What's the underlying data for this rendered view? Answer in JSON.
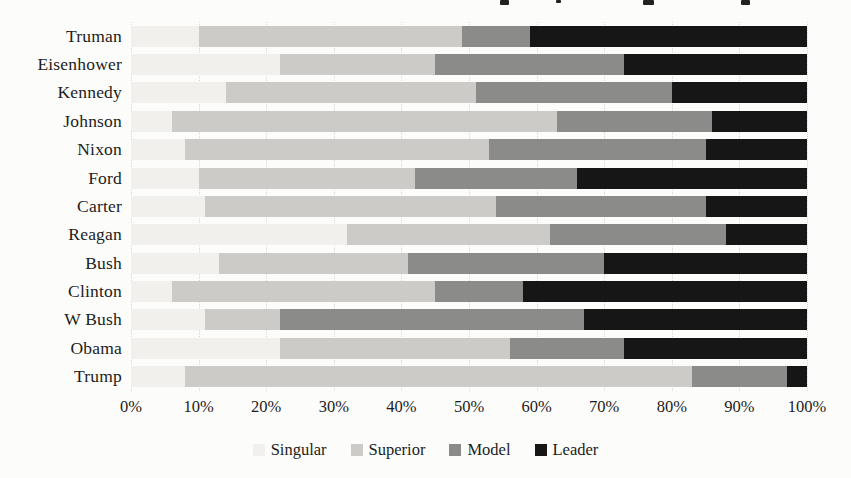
{
  "page": {
    "background": "#fcfcfa",
    "text_color": "#1c1c1c",
    "gridline_color": "#dbd8d4"
  },
  "chart_data": {
    "type": "bar",
    "orientation": "horizontal",
    "stacked": true,
    "stacked_total": 100,
    "title": "",
    "xlabel": "",
    "ylabel": "",
    "categories": [
      "Truman",
      "Eisenhower",
      "Kennedy",
      "Johnson",
      "Nixon",
      "Ford",
      "Carter",
      "Reagan",
      "Bush",
      "Clinton",
      "W Bush",
      "Obama",
      "Trump"
    ],
    "series": [
      {
        "name": "Singular",
        "color": "#f1f0ed",
        "values": [
          10,
          22,
          14,
          6,
          8,
          10,
          11,
          32,
          13,
          6,
          11,
          22,
          8
        ]
      },
      {
        "name": "Superior",
        "color": "#cccbc8",
        "values": [
          39,
          23,
          37,
          57,
          45,
          32,
          43,
          30,
          28,
          39,
          11,
          34,
          75
        ]
      },
      {
        "name": "Model",
        "color": "#8b8b89",
        "values": [
          10,
          28,
          29,
          23,
          32,
          24,
          31,
          26,
          29,
          13,
          45,
          17,
          14
        ]
      },
      {
        "name": "Leader",
        "color": "#161616",
        "values": [
          41,
          27,
          20,
          14,
          15,
          34,
          15,
          12,
          30,
          42,
          33,
          27,
          3
        ]
      }
    ],
    "x_axis": {
      "range": [
        0,
        100
      ],
      "tick_labels": [
        "0%",
        "10%",
        "20%",
        "30%",
        "40%",
        "50%",
        "60%",
        "70%",
        "80%",
        "90%",
        "100%"
      ],
      "gridlines": "dotted-vertical"
    },
    "legend": {
      "position": "bottom-center",
      "entries": [
        "Singular",
        "Superior",
        "Model",
        "Leader"
      ]
    }
  }
}
